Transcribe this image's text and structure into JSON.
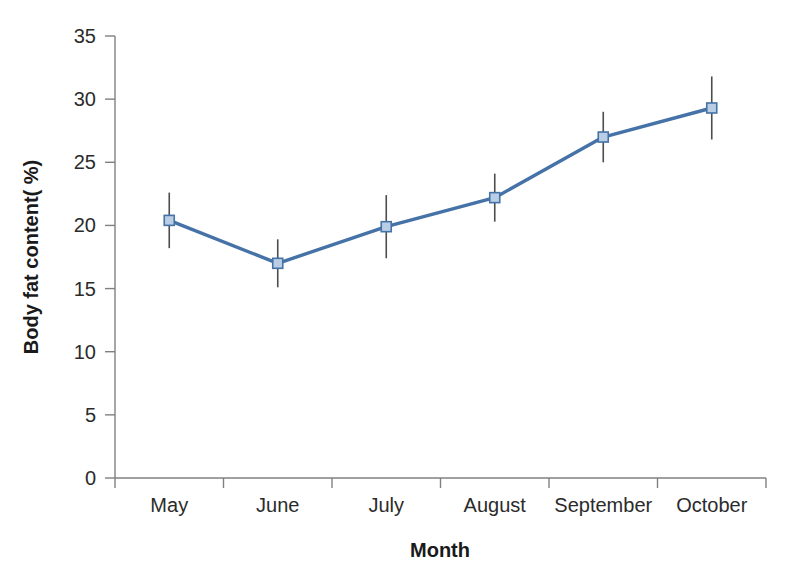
{
  "chart_data": {
    "type": "line",
    "title": "",
    "subtitle": "",
    "xlabel": "Month",
    "ylabel": "Body fat content( %)",
    "categories": [
      "May",
      "June",
      "July",
      "August",
      "September",
      "October"
    ],
    "series": [
      {
        "name": "Body fat content",
        "values": [
          20.4,
          17.0,
          19.9,
          22.2,
          27.0,
          29.3
        ],
        "errors": [
          2.2,
          1.9,
          2.5,
          1.9,
          2.0,
          2.5
        ],
        "color": "#4572A7",
        "marker": "square",
        "marker_fill": "#B9CDE5",
        "marker_edge": "#4572A7"
      }
    ],
    "ylim": [
      0,
      35
    ],
    "yticks": [
      0,
      5,
      10,
      15,
      20,
      25,
      30,
      35
    ],
    "ytick_labels": [
      "0",
      "5",
      "10",
      "15",
      "20",
      "25",
      "30",
      "35"
    ],
    "grid": false,
    "legend": "none",
    "errorbar_color": "#4d4d4d",
    "axis_color": "#808080"
  },
  "figure": {
    "background": "#ffffff",
    "width": 792,
    "height": 586
  }
}
